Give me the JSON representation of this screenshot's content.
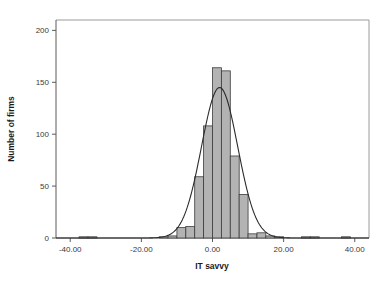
{
  "chart_data": {
    "type": "bar",
    "title": "",
    "subtitle": "",
    "xlabel": "IT savvy",
    "ylabel": "Number of firms",
    "xlim": [
      -44,
      44
    ],
    "ylim": [
      0,
      210
    ],
    "grid": false,
    "legend": null,
    "bin_width": 2.5,
    "x_tick_labels": [
      "-40.00",
      "-20.00",
      "0.00",
      "20.00",
      "40.00"
    ],
    "x_tick_values": [
      -40,
      -20,
      0,
      20,
      40
    ],
    "y_tick_labels": [
      "0",
      "50",
      "100",
      "150",
      "200"
    ],
    "y_tick_values": [
      0,
      50,
      100,
      150,
      200
    ],
    "categories": [
      -36.25,
      -33.75,
      -13.75,
      -11.25,
      -8.75,
      -6.25,
      -3.75,
      -1.25,
      1.25,
      3.75,
      6.25,
      8.75,
      11.25,
      13.75,
      16.25,
      18.75,
      26.25,
      28.75,
      37.5
    ],
    "values": [
      1,
      1,
      1,
      2,
      10,
      11,
      59,
      108,
      164,
      161,
      79,
      42,
      4,
      5,
      2,
      1,
      1,
      1,
      1
    ],
    "bars": [
      {
        "x": -36.25,
        "value": 1
      },
      {
        "x": -33.75,
        "value": 1
      },
      {
        "x": -13.75,
        "value": 1
      },
      {
        "x": -11.25,
        "value": 2
      },
      {
        "x": -8.75,
        "value": 10
      },
      {
        "x": -6.25,
        "value": 11
      },
      {
        "x": -3.75,
        "value": 59
      },
      {
        "x": -1.25,
        "value": 108
      },
      {
        "x": 1.25,
        "value": 164
      },
      {
        "x": 3.75,
        "value": 161
      },
      {
        "x": 6.25,
        "value": 79
      },
      {
        "x": 8.75,
        "value": 42
      },
      {
        "x": 11.25,
        "value": 4
      },
      {
        "x": 13.75,
        "value": 5
      },
      {
        "x": 16.25,
        "value": 2
      },
      {
        "x": 18.75,
        "value": 1
      },
      {
        "x": 26.25,
        "value": 1
      },
      {
        "x": 28.75,
        "value": 1
      },
      {
        "x": 37.5,
        "value": 1
      }
    ],
    "overlay_curve": {
      "name": "normal-distribution-curve",
      "peak_value": 145,
      "mean": 2.0,
      "std_dev": 5.1
    },
    "colors": {
      "bar_fill": "#b3b3b3",
      "bar_border": "#3c3c3c",
      "curve": "#2b2b2b",
      "axis": "#5a5a5a",
      "frame": "#9a9a9a",
      "text": "#1a1a1a",
      "background": "#ffffff"
    }
  }
}
